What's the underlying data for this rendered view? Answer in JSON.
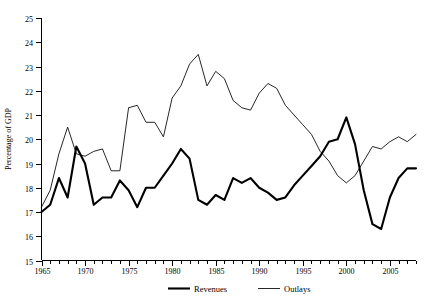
{
  "chart_data": {
    "type": "line",
    "title": "",
    "xlabel": "",
    "ylabel": "Percentage of GDP",
    "xlim": [
      1965,
      2008
    ],
    "ylim": [
      15,
      25
    ],
    "grid": false,
    "legend_position": "bottom",
    "x_ticks_major": [
      1965,
      1970,
      1975,
      1980,
      1985,
      1990,
      1995,
      2000,
      2005
    ],
    "x_tick_labels": [
      "1965",
      "1970",
      "1975",
      "1980",
      "1985",
      "1990",
      "1995",
      "2000",
      "2005"
    ],
    "y_ticks": [
      15,
      16,
      17,
      18,
      19,
      20,
      21,
      22,
      23,
      24,
      25
    ],
    "y_tick_labels": [
      "15",
      "16",
      "17",
      "18",
      "19",
      "20",
      "21",
      "22",
      "23",
      "24",
      "25"
    ],
    "x": [
      1965,
      1966,
      1967,
      1968,
      1969,
      1970,
      1971,
      1972,
      1973,
      1974,
      1975,
      1976,
      1977,
      1978,
      1979,
      1980,
      1981,
      1982,
      1983,
      1984,
      1985,
      1986,
      1987,
      1988,
      1989,
      1990,
      1991,
      1992,
      1993,
      1994,
      1995,
      1996,
      1997,
      1998,
      1999,
      2000,
      2001,
      2002,
      2003,
      2004,
      2005,
      2006,
      2007,
      2008
    ],
    "series": [
      {
        "name": "Revenues",
        "style": "thick-black",
        "values": [
          17.0,
          17.3,
          18.4,
          17.6,
          19.7,
          19.0,
          17.3,
          17.6,
          17.6,
          18.3,
          17.9,
          17.2,
          18.0,
          18.0,
          18.5,
          19.0,
          19.6,
          19.2,
          17.5,
          17.3,
          17.7,
          17.5,
          18.4,
          18.2,
          18.4,
          18.0,
          17.8,
          17.5,
          17.6,
          18.1,
          18.5,
          18.9,
          19.3,
          19.9,
          20.0,
          20.9,
          19.8,
          17.9,
          16.5,
          16.3,
          17.6,
          18.4,
          18.8,
          18.8
        ]
      },
      {
        "name": "Outlays",
        "style": "thin-black",
        "values": [
          17.2,
          17.9,
          19.4,
          20.5,
          19.4,
          19.3,
          19.5,
          19.6,
          18.7,
          18.7,
          21.3,
          21.4,
          20.7,
          20.7,
          20.1,
          21.7,
          22.2,
          23.1,
          23.5,
          22.2,
          22.8,
          22.5,
          21.6,
          21.3,
          21.2,
          21.9,
          22.3,
          22.1,
          21.4,
          21.0,
          20.6,
          20.2,
          19.5,
          19.1,
          18.5,
          18.2,
          18.5,
          19.1,
          19.7,
          19.6,
          19.9,
          20.1,
          19.9,
          20.2
        ]
      }
    ],
    "legend": [
      {
        "label": "Revenues",
        "style": "thick-black"
      },
      {
        "label": "Outlays",
        "style": "thin-black"
      }
    ],
    "colors": {
      "revenues": "#000000",
      "outlays": "#000000",
      "axis": "#000000",
      "background": "#ffffff"
    }
  }
}
